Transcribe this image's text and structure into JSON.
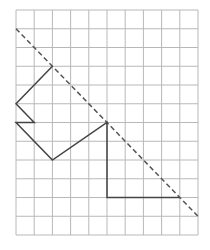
{
  "grid": {
    "columns": 10,
    "rows": 12,
    "origin_x": 16,
    "origin_y": 10,
    "cell_w": 18.2,
    "cell_h": 18.75,
    "line_color": "#b8b8b8"
  },
  "mirror_line": {
    "style": "dashed",
    "color": "#555555",
    "from": [
      0,
      1
    ],
    "to": [
      10,
      11
    ]
  },
  "shape": {
    "style": "solid",
    "color": "#444444",
    "points": [
      [
        2,
        3
      ],
      [
        0,
        5
      ],
      [
        1,
        6
      ],
      [
        0,
        6
      ],
      [
        2,
        8
      ],
      [
        5,
        6
      ],
      [
        5,
        10
      ],
      [
        9,
        10
      ]
    ]
  }
}
